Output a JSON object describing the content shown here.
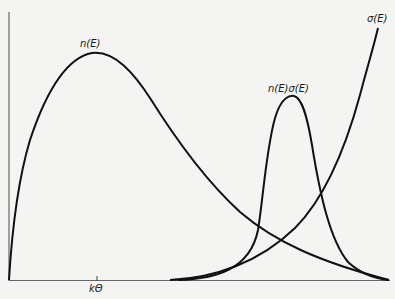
{
  "figure": {
    "curves": [
      {
        "id": "n",
        "label": "n(E)",
        "shape": "rises from origin, peaks near kΘ, decays exponentially toward high E"
      },
      {
        "id": "sigma",
        "label": "σ(E)",
        "shape": "near zero at low E, rises steeply at high E"
      },
      {
        "id": "product",
        "label": "n(E)σ(E)",
        "shape": "narrow peak at high E where the two curves overlap"
      }
    ],
    "axis": {
      "x_tick_label": "kΘ",
      "x_tick_position_fraction": 0.23
    }
  },
  "labels": {
    "n": "n(E)",
    "product": "n(E)σ(E)",
    "sigma": "σ(E)",
    "ktheta": "kΘ"
  },
  "colors": {
    "background": "#f4f4f2",
    "ink": "#111111",
    "axis": "#555555"
  }
}
